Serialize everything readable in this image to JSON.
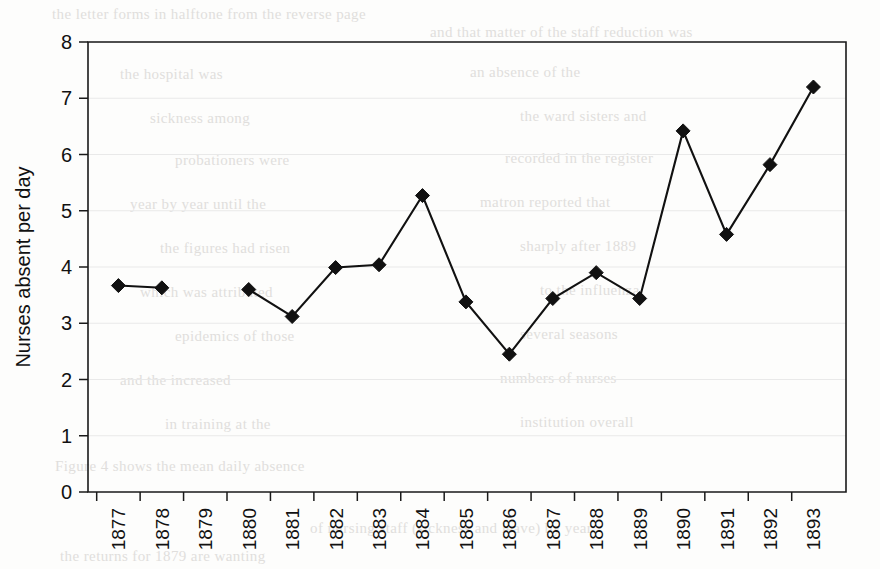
{
  "figure": {
    "background_color": "#fdfdfc",
    "ink_color": "#111111",
    "grid_color": "#e9e9e9"
  },
  "axis_titles": {
    "y": "Nurses absent per day",
    "x": ""
  },
  "y_ticks": [
    "0",
    "1",
    "2",
    "3",
    "4",
    "5",
    "6",
    "7",
    "8"
  ],
  "x_ticks": [
    "1877",
    "1878",
    "1879",
    "1880",
    "1881",
    "1882",
    "1883",
    "1884",
    "1885",
    "1886",
    "1887",
    "1888",
    "1889",
    "1890",
    "1891",
    "1892",
    "1893"
  ],
  "background_bleed": [
    {
      "text": "the letter forms in halftone from the reverse page",
      "x": 52,
      "y": 6
    },
    {
      "text": "and that matter of the staff reduction was",
      "x": 430,
      "y": 24
    },
    {
      "text": "the hospital was",
      "x": 120,
      "y": 66
    },
    {
      "text": "an absence of the",
      "x": 470,
      "y": 64
    },
    {
      "text": "sickness among",
      "x": 150,
      "y": 110
    },
    {
      "text": "the ward sisters and",
      "x": 520,
      "y": 108
    },
    {
      "text": "probationers were",
      "x": 175,
      "y": 152
    },
    {
      "text": "recorded in the register",
      "x": 505,
      "y": 150
    },
    {
      "text": "year by year until the",
      "x": 130,
      "y": 196
    },
    {
      "text": "matron reported that",
      "x": 480,
      "y": 194
    },
    {
      "text": "the figures had risen",
      "x": 160,
      "y": 240
    },
    {
      "text": "sharply after 1889",
      "x": 520,
      "y": 238
    },
    {
      "text": "which was attributed",
      "x": 140,
      "y": 284
    },
    {
      "text": "to the influenza",
      "x": 540,
      "y": 282
    },
    {
      "text": "epidemics of those",
      "x": 175,
      "y": 328
    },
    {
      "text": "several seasons",
      "x": 520,
      "y": 326
    },
    {
      "text": "and the increased",
      "x": 120,
      "y": 372
    },
    {
      "text": "numbers of nurses",
      "x": 500,
      "y": 370
    },
    {
      "text": "in training at the",
      "x": 165,
      "y": 416
    },
    {
      "text": "institution overall",
      "x": 520,
      "y": 414
    },
    {
      "text": "Figure 4 shows the mean daily absence",
      "x": 55,
      "y": 458
    },
    {
      "text": "of nursing staff (sickness and leave) by year",
      "x": 310,
      "y": 520
    },
    {
      "text": "the returns for 1879 are wanting",
      "x": 60,
      "y": 548
    }
  ],
  "chart_data": {
    "type": "line",
    "title": "",
    "xlabel": "",
    "ylabel": "Nurses absent per day",
    "x": [
      "1877",
      "1878",
      "1879",
      "1880",
      "1881",
      "1882",
      "1883",
      "1884",
      "1885",
      "1886",
      "1887",
      "1888",
      "1889",
      "1890",
      "1891",
      "1892",
      "1893"
    ],
    "values": [
      3.67,
      3.63,
      null,
      3.6,
      3.12,
      3.99,
      4.04,
      5.27,
      3.38,
      2.45,
      3.44,
      3.9,
      3.44,
      6.42,
      4.58,
      5.82,
      7.2
    ],
    "ylim": [
      0,
      8
    ],
    "ytick_step": 1,
    "grid": true,
    "grid_axis": "y",
    "legend": false,
    "marker": "diamond",
    "missing_points": [
      "1879"
    ]
  }
}
